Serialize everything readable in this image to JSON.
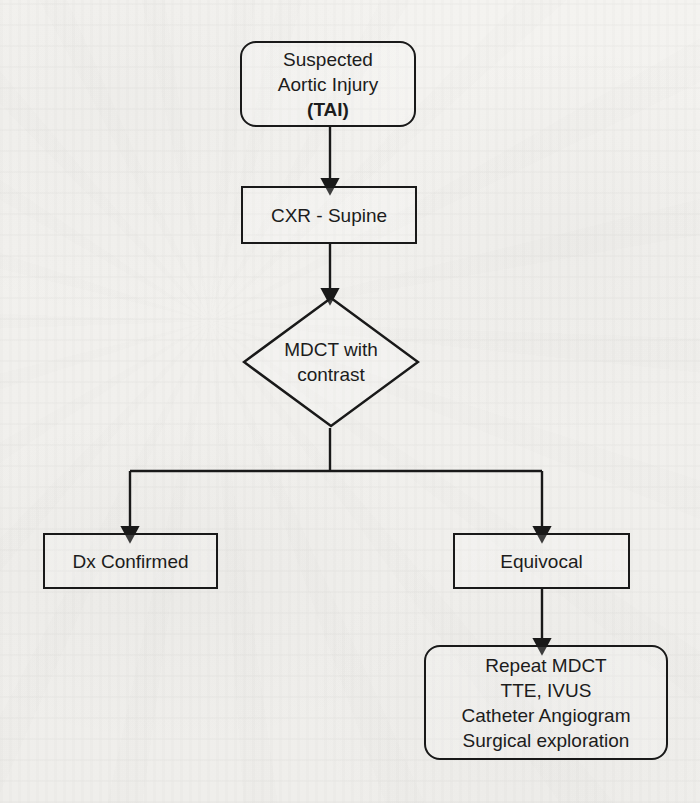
{
  "document": {
    "kind": "clinical-algorithm-flowchart",
    "title": "Suspected Aortic Injury (TAI) diagnostic algorithm",
    "ink_color": "#191919",
    "paper_color": "#f2f1ee"
  },
  "nodes": {
    "suspected_tai": {
      "name": "Suspected Aortic Injury (TAI)",
      "shape": "rounded-rectangle",
      "lines": [
        "Suspected",
        "Aortic Injury",
        "(TAI)"
      ],
      "line1": "Suspected",
      "line2": "Aortic Injury",
      "line3": "(TAI)"
    },
    "cxr_supine": {
      "name": "CXR - Supine",
      "shape": "rectangle",
      "line1": "CXR - Supine"
    },
    "mdct_contrast": {
      "name": "MDCT with contrast",
      "shape": "diamond",
      "line1": "MDCT with",
      "line2": "contrast"
    },
    "dx_confirmed": {
      "name": "Dx Confirmed",
      "shape": "rectangle",
      "line1": "Dx Confirmed"
    },
    "equivocal": {
      "name": "Equivocal",
      "shape": "rectangle",
      "line1": "Equivocal"
    },
    "further_workup": {
      "name": "Further workup options",
      "shape": "rounded-rectangle",
      "lines": [
        "Repeat MDCT",
        "TTE, IVUS",
        "Catheter Angiogram",
        "Surgical exploration"
      ],
      "line1": "Repeat MDCT",
      "line2": "TTE, IVUS",
      "line3": "Catheter Angiogram",
      "line4": "Surgical exploration"
    }
  },
  "edges": [
    {
      "from": "suspected_tai",
      "to": "cxr_supine",
      "style": "straight-arrow"
    },
    {
      "from": "cxr_supine",
      "to": "mdct_contrast",
      "style": "straight-arrow"
    },
    {
      "from": "mdct_contrast",
      "to": "dx_confirmed",
      "style": "elbow-arrow-left"
    },
    {
      "from": "mdct_contrast",
      "to": "equivocal",
      "style": "elbow-arrow-right"
    },
    {
      "from": "equivocal",
      "to": "further_workup",
      "style": "straight-arrow"
    }
  ]
}
